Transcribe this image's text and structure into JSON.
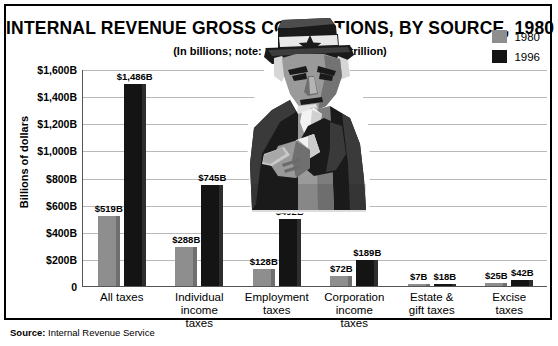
{
  "chart_data": {
    "type": "bar",
    "title": "INTERNAL REVENUE GROSS COLLECTIONS, BY SOURCE, 1980 vs. 1996",
    "subtitle": "(In billions; note: 1,000 billion = 1 trillion)",
    "xlabel": "",
    "ylabel": "Billions of dollars",
    "ylim": [
      0,
      1600
    ],
    "grid": true,
    "legend_position": "top-right",
    "ytick_labels": [
      "$1,600B",
      "$1,400B",
      "$1,200B",
      "$1,000B",
      "$800B",
      "$600B",
      "$400B",
      "$200B",
      "0"
    ],
    "ytick_values": [
      1600,
      1400,
      1200,
      1000,
      800,
      600,
      400,
      200,
      0
    ],
    "categories": [
      "All taxes",
      "Individual income taxes",
      "Employment taxes",
      "Corporation income taxes",
      "Estate & gift taxes",
      "Excise taxes"
    ],
    "category_lines": [
      [
        "All taxes"
      ],
      [
        "Individual",
        "income",
        "taxes"
      ],
      [
        "Employment",
        "taxes"
      ],
      [
        "Corporation",
        "income",
        "taxes"
      ],
      [
        "Estate &",
        "gift taxes"
      ],
      [
        "Excise",
        "taxes"
      ]
    ],
    "series": [
      {
        "name": "1980",
        "color": "#8e8e8e",
        "values": [
          519,
          288,
          128,
          72,
          7,
          25
        ],
        "labels": [
          "$519B",
          "$288B",
          "$128B",
          "$72B",
          "$7B",
          "$25B"
        ]
      },
      {
        "name": "1996",
        "color": "#141414",
        "values": [
          1486,
          745,
          492,
          189,
          18,
          42
        ],
        "labels": [
          "$1,486B",
          "$745B",
          "$492B",
          "$189B",
          "$18B",
          "$42B"
        ]
      }
    ]
  },
  "legend": {
    "items": [
      {
        "label": "1980",
        "color": "#8e8e8e"
      },
      {
        "label": "1996",
        "color": "#141414"
      }
    ]
  },
  "footer": {
    "source_label": "Source:",
    "source_value": "Internal Revenue Service"
  },
  "illustration": {
    "name": "uncle-sam-pointing"
  }
}
